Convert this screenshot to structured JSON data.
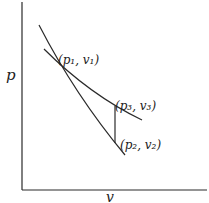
{
  "diagram": {
    "type": "p-v diagram",
    "axes": {
      "y_label": "p",
      "x_label": "v"
    },
    "points": [
      {
        "id": "p1v1",
        "label": "(p₁, v₁)"
      },
      {
        "id": "p3v3",
        "label": "(p₃, v₃)"
      },
      {
        "id": "p2v2",
        "label": "(p₂, v₂)"
      }
    ],
    "curves": [
      {
        "name": "steep-curve",
        "from": "above p1v1",
        "to": "p2v2"
      },
      {
        "name": "flat-curve",
        "from": "above p1v1",
        "to": "beyond p3v3"
      },
      {
        "name": "vertical-segment",
        "from": "p3v3",
        "to": "p2v2"
      }
    ]
  }
}
